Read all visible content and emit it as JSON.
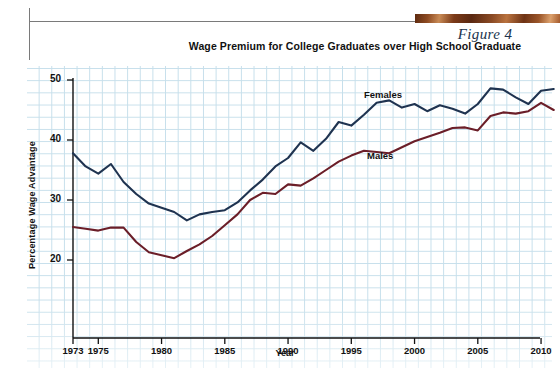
{
  "header": {
    "figure_label": "Figure 4",
    "decor_bar": "copper-gradient-bar"
  },
  "chart_data": {
    "type": "line",
    "title": "Wage Premium for College Graduates over High School Graduate",
    "xlabel": "Year",
    "ylabel": "Percentage Wage Advantage",
    "xlim": [
      1973,
      2011
    ],
    "ylim": [
      15,
      52
    ],
    "yticks": [
      20,
      30,
      40,
      50
    ],
    "xticks": [
      1973,
      1975,
      1980,
      1985,
      1990,
      1995,
      2000,
      2005,
      2010
    ],
    "grid": true,
    "legend": "inline-labels",
    "x": [
      1973,
      1974,
      1975,
      1976,
      1977,
      1978,
      1979,
      1980,
      1981,
      1982,
      1983,
      1984,
      1985,
      1986,
      1987,
      1988,
      1989,
      1990,
      1991,
      1992,
      1993,
      1994,
      1995,
      1996,
      1997,
      1998,
      1999,
      2000,
      2001,
      2002,
      2003,
      2004,
      2005,
      2006,
      2007,
      2008,
      2009,
      2010,
      2011
    ],
    "series": [
      {
        "name": "Females",
        "color": "#1f3350",
        "label": "Females",
        "values": [
          37.8,
          35.6,
          34.4,
          36.0,
          33.0,
          31.0,
          29.4,
          28.7,
          28.0,
          26.6,
          27.6,
          28.0,
          28.3,
          29.6,
          31.6,
          33.4,
          35.6,
          37.0,
          39.6,
          38.2,
          40.2,
          43.0,
          42.4,
          44.2,
          46.2,
          46.6,
          45.4,
          46.0,
          44.8,
          45.8,
          45.2,
          44.4,
          46.0,
          48.6,
          48.4,
          47.1,
          46.0,
          48.2,
          48.5
        ]
      },
      {
        "name": "Males",
        "color": "#6b1e28",
        "label": "Males",
        "values": [
          25.5,
          25.2,
          24.9,
          25.4,
          25.4,
          23.0,
          21.3,
          20.8,
          20.3,
          21.5,
          22.6,
          24.0,
          25.8,
          27.6,
          30.0,
          31.2,
          31.0,
          32.6,
          32.4,
          33.6,
          35.0,
          36.4,
          37.4,
          38.2,
          38.0,
          37.8,
          38.8,
          39.8,
          40.5,
          41.2,
          42.0,
          42.1,
          41.6,
          44.0,
          44.6,
          44.4,
          44.8,
          46.2,
          45.0
        ]
      }
    ]
  }
}
